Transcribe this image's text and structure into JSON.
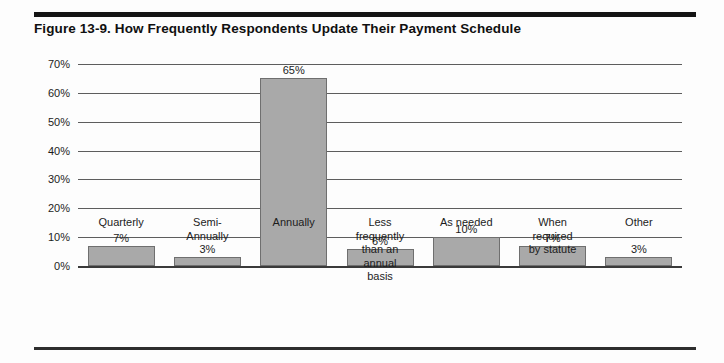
{
  "figure": {
    "title": "Figure 13-9. How Frequently Respondents Update Their Payment Schedule"
  },
  "chart_data": {
    "type": "bar",
    "title": "Figure 13-9. How Frequently Respondents Update Their Payment Schedule",
    "xlabel": "",
    "ylabel": "",
    "ylim": [
      0,
      70
    ],
    "ytick_labels": [
      "70%",
      "60%",
      "50%",
      "40%",
      "30%",
      "20%",
      "10%",
      "0%"
    ],
    "ytick_values": [
      70,
      60,
      50,
      40,
      30,
      20,
      10,
      0
    ],
    "grid": true,
    "legend": "none",
    "categories": [
      "Quarterly",
      "Semi-\nAnnually",
      "Annually",
      "Less\nfrequently\nthan an\nannual\nbasis",
      "As needed",
      "When\nrequired\nby statute",
      "Other"
    ],
    "values": [
      7,
      3,
      65,
      6,
      10,
      7,
      3
    ],
    "data_labels": [
      "7%",
      "3%",
      "65%",
      "6%",
      "10%",
      "7%",
      "3%"
    ],
    "bar_color": "#a9a9a9",
    "bar_edge_color": "#6f6f6f"
  }
}
